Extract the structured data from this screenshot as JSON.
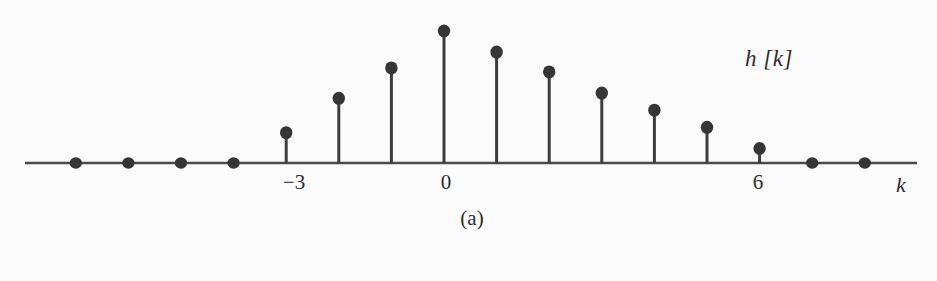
{
  "figure": {
    "subfigure_label": "(a)",
    "signal_label": "h [k]",
    "axis_label": "k",
    "background_color": "#fbfbfb",
    "ink_color": "#353535"
  },
  "chart_data": {
    "type": "stem",
    "title": "",
    "subtitle": "(a)",
    "xlabel": "k",
    "ylabel": "h [k]",
    "series_name": "h[k]",
    "grid": false,
    "legend": "none",
    "axis_only_x": true,
    "xlim": [
      -7,
      8
    ],
    "ylim": [
      0,
      1.05
    ],
    "x": [
      -7,
      -6,
      -5,
      -4,
      -3,
      -2,
      -1,
      0,
      1,
      2,
      3,
      4,
      5,
      6,
      7,
      8
    ],
    "values": [
      0,
      0,
      0,
      0,
      0.23,
      0.49,
      0.72,
      1.0,
      0.84,
      0.69,
      0.53,
      0.4,
      0.27,
      0.11,
      0,
      0
    ],
    "tick_values": [
      -3,
      0,
      6
    ],
    "tick_labels": [
      "−3",
      "0",
      "6"
    ],
    "marker": "filled-circle",
    "marker_color": "#353535",
    "stem_color": "#3d3d3d",
    "baseline_color": "#4a4a4a"
  },
  "geometry": {
    "baseline_y": 163,
    "x_origin_px": 444,
    "x_step_px": 52.6,
    "peak_height_px": 132,
    "axis_x_start": 25,
    "axis_x_end": 917,
    "dot_radius": 6.2,
    "stem_width": 3,
    "baseline_width": 2.6
  },
  "labels": {
    "tick_minus3": {
      "text": "−3",
      "x": 294,
      "y": 172
    },
    "tick_zero": {
      "text": "0",
      "x": 446,
      "y": 172
    },
    "tick_six": {
      "text": "6",
      "x": 758,
      "y": 172
    },
    "axis_k": {
      "text": "k",
      "x": 901,
      "y": 174
    },
    "signal": {
      "text": "h [k]",
      "x": 745,
      "y": 47
    },
    "subfigure": {
      "text": "(a)",
      "x": 472,
      "y": 208
    }
  }
}
